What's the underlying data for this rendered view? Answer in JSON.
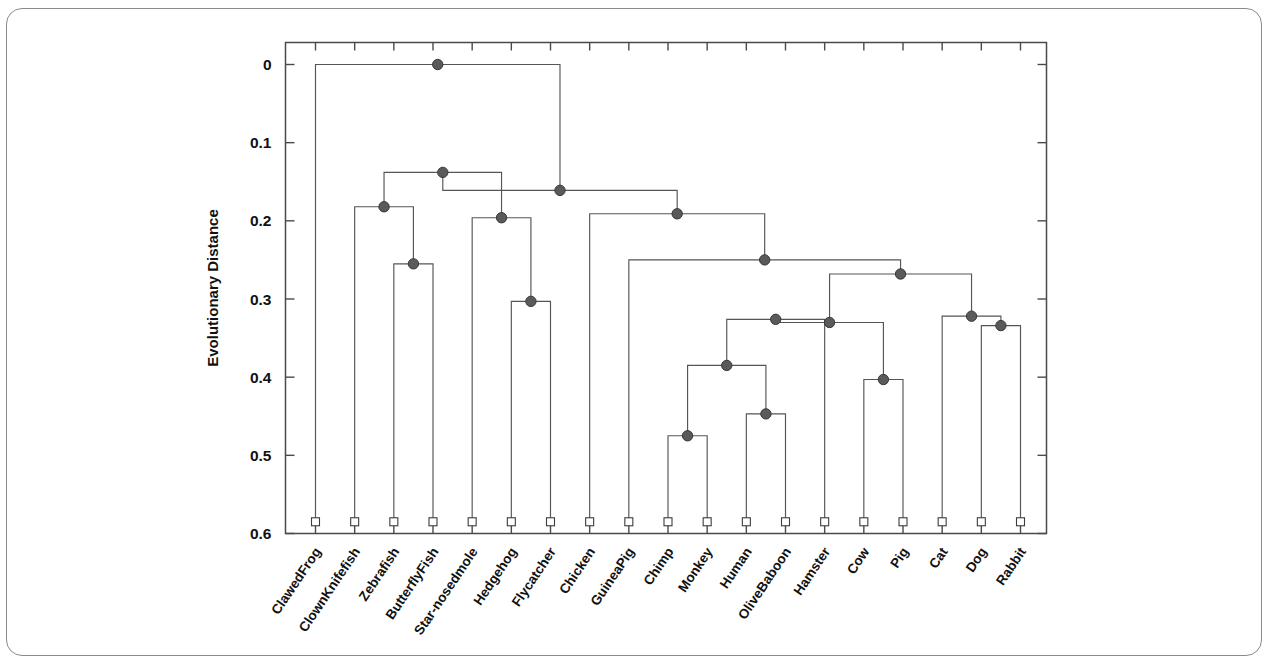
{
  "figure": {
    "background_color": "#ffffff",
    "frame_color": "#8b8b8b",
    "line_color": "#555555",
    "node_color": "#5a5a5a",
    "leaf_marker_color": "#ffffff"
  },
  "chart_data": {
    "type": "dendrogram",
    "title": "",
    "xlabel": "",
    "ylabel": "Evolutionary Distance",
    "ylim": [
      0,
      0.6
    ],
    "y_inverted": true,
    "grid": false,
    "legend": "none",
    "ytick_labels": [
      "0",
      "0.1",
      "0.2",
      "0.3",
      "0.4",
      "0.5",
      "0.6"
    ],
    "ytick_values": [
      0,
      0.1,
      0.2,
      0.3,
      0.4,
      0.5,
      0.6
    ],
    "leaf_labels": [
      "ClawedFrog",
      "ClownKnifefish",
      "Zebrafish",
      "ButterflyFish",
      "Star-nosedmole",
      "Hedgehog",
      "Flycatcher",
      "Chicken",
      "GuineaPig",
      "Chimp",
      "Monkey",
      "Human",
      "OliveBaboon",
      "Hamster",
      "Cow",
      "Pig",
      "Cat",
      "Dog",
      "Rabbit"
    ],
    "leaf_count": 19,
    "leaf_distance": 0.585,
    "merges": [
      {
        "id": "m1",
        "left": "Zebrafish",
        "right": "ButterflyFish",
        "height": 0.255
      },
      {
        "id": "m2",
        "left": "ClownKnifefish",
        "right": "m1",
        "height": 0.182
      },
      {
        "id": "m3",
        "left": "Hedgehog",
        "right": "Flycatcher",
        "height": 0.303
      },
      {
        "id": "m4",
        "left": "Star-nosedmole",
        "right": "m3",
        "height": 0.196
      },
      {
        "id": "m5",
        "left": "m2",
        "right": "m4",
        "height": 0.138
      },
      {
        "id": "m6",
        "left": "Chimp",
        "right": "Monkey",
        "height": 0.475
      },
      {
        "id": "m7",
        "left": "Human",
        "right": "OliveBaboon",
        "height": 0.447
      },
      {
        "id": "m8",
        "left": "m6",
        "right": "m7",
        "height": 0.385
      },
      {
        "id": "m9",
        "left": "Hamster",
        "right": "m8",
        "height": 0.326
      },
      {
        "id": "m10",
        "left": "Cow",
        "right": "Pig",
        "height": 0.403
      },
      {
        "id": "m11",
        "left": "m9",
        "right": "m10",
        "height": 0.33
      },
      {
        "id": "m12",
        "left": "Dog",
        "right": "Rabbit",
        "height": 0.334
      },
      {
        "id": "m13",
        "left": "Cat",
        "right": "m12",
        "height": 0.322
      },
      {
        "id": "m14",
        "left": "m11",
        "right": "m13",
        "height": 0.268
      },
      {
        "id": "m15",
        "left": "GuineaPig",
        "right": "m14",
        "height": 0.25
      },
      {
        "id": "m16",
        "left": "Chicken",
        "right": "m15",
        "height": 0.191
      },
      {
        "id": "m17",
        "left": "m5",
        "right": "m16",
        "height": 0.161
      },
      {
        "id": "m18",
        "left": "ClawedFrog",
        "right": "m17",
        "height": 0.0
      }
    ]
  }
}
